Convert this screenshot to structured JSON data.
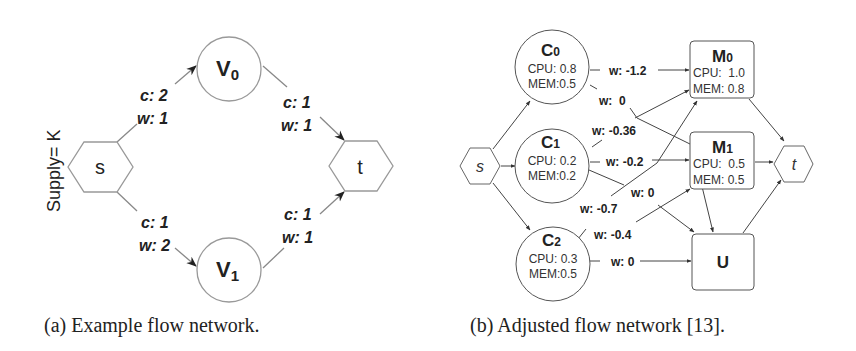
{
  "panel_a": {
    "supply_label": "Supply= K",
    "nodes": {
      "s": "s",
      "t": "t",
      "v0": {
        "main": "V",
        "sub": "0"
      },
      "v1": {
        "main": "V",
        "sub": "1"
      }
    },
    "edges": {
      "s_v0": {
        "c": "c: 2",
        "w": "w: 1"
      },
      "v0_t": {
        "c": "c: 1",
        "w": "w: 1"
      },
      "s_v1": {
        "c": "c: 1",
        "w": "w: 2"
      },
      "v1_t": {
        "c": "c: 1",
        "w": "w: 1"
      }
    },
    "caption": "(a) Example flow network."
  },
  "panel_b": {
    "nodes": {
      "s": "s",
      "t": "t",
      "c0": {
        "main": "C",
        "sub": "0",
        "cpu": "CPU: 0.8",
        "mem": "MEM:0.5"
      },
      "c1": {
        "main": "C",
        "sub": "1",
        "cpu": "CPU: 0.2",
        "mem": "MEM:0.2"
      },
      "c2": {
        "main": "C",
        "sub": "2",
        "cpu": "CPU: 0.3",
        "mem": "MEM:0.5"
      },
      "m0": {
        "main": "M",
        "sub": "0",
        "cpu": "CPU:  1.0",
        "mem": "MEM: 0.8"
      },
      "m1": {
        "main": "M",
        "sub": "1",
        "cpu": "CPU:  0.5",
        "mem": "MEM: 0.5"
      },
      "u": "U"
    },
    "edges": {
      "c0_m0": "w: -1.2",
      "c0_u": "w:  0",
      "c1_m0": "w: -0.36",
      "c1_m1": "w: -0.2",
      "c1_u": "w: 0",
      "c2_m0": "w: -0.7",
      "c2_m1": "w: -0.4",
      "c2_u": "w: 0"
    },
    "caption": "(b) Adjusted flow network [13]."
  },
  "colors": {
    "stroke": "#777777",
    "text": "#222222",
    "arrow": "#333333"
  }
}
